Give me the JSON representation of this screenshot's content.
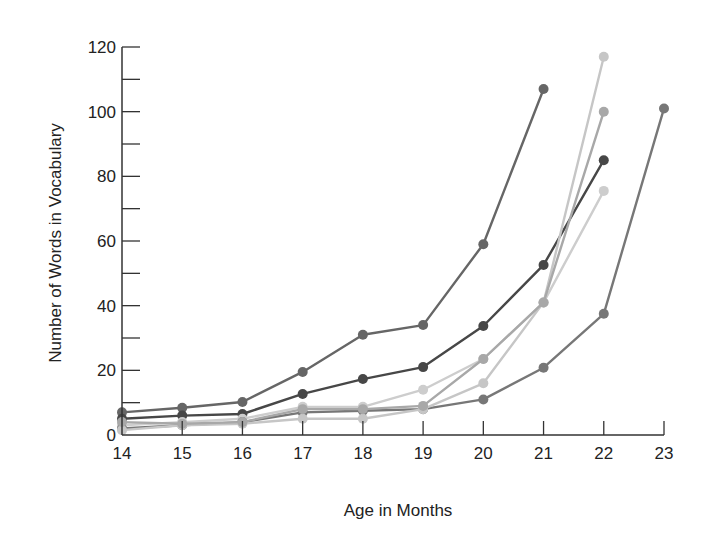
{
  "chart_data": {
    "type": "line",
    "title": "",
    "xlabel": "Age in Months",
    "ylabel": "Number of Words in Vocabulary",
    "x_ticks": [
      14,
      15,
      16,
      17,
      18,
      19,
      20,
      21,
      22,
      23
    ],
    "y_ticks": [
      0,
      20,
      40,
      60,
      80,
      100,
      120
    ],
    "y_minor_step": 10,
    "xlim": [
      14,
      23
    ],
    "ylim": [
      0,
      120
    ],
    "grid": false,
    "legend": "none",
    "series": [
      {
        "name": "Child 1",
        "color": "#666666",
        "x": [
          14,
          15,
          16,
          17,
          18,
          19,
          20,
          21
        ],
        "values": [
          7,
          8.4,
          10.2,
          19.5,
          31,
          34,
          59,
          107
        ]
      },
      {
        "name": "Child 2",
        "color": "#474747",
        "x": [
          14,
          15,
          16,
          17,
          18,
          19,
          20,
          21,
          22
        ],
        "values": [
          5,
          6,
          6.5,
          12.7,
          17.3,
          21,
          33.7,
          52.6,
          85
        ]
      },
      {
        "name": "Child 3",
        "color": "#cdcdcd",
        "x": [
          14,
          15,
          16,
          17,
          18,
          19,
          20,
          21,
          22
        ],
        "values": [
          3,
          4,
          5,
          8.7,
          8.7,
          14,
          23.5,
          41,
          75.5
        ]
      },
      {
        "name": "Child 4",
        "color": "#777777",
        "x": [
          14,
          15,
          16,
          17,
          18,
          19,
          20,
          21,
          22,
          23
        ],
        "values": [
          2,
          3,
          4,
          7,
          7.5,
          8,
          11,
          20.8,
          37.5,
          101
        ]
      },
      {
        "name": "Child 5",
        "color": "#c6c6c6",
        "x": [
          14,
          15,
          16,
          17,
          18,
          19,
          20,
          21,
          22
        ],
        "values": [
          1.5,
          3,
          3.5,
          5,
          5,
          8,
          16,
          41,
          117
        ]
      },
      {
        "name": "Child 6",
        "color": "#a8a8a8",
        "x": [
          14,
          15,
          16,
          17,
          18,
          19,
          20,
          21,
          22
        ],
        "values": [
          4,
          3.5,
          4,
          8,
          8,
          9,
          23.5,
          41,
          100
        ]
      }
    ]
  }
}
